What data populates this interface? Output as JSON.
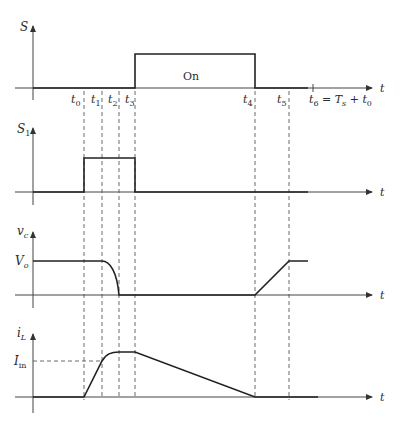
{
  "diagram": {
    "type": "timing-diagram",
    "time_axis_label": "t",
    "time_markers": [
      "t0",
      "t1",
      "t2",
      "t3",
      "t4",
      "t5",
      "t6 = Ts + t0"
    ],
    "panels": [
      {
        "id": "S",
        "ylabel": "S",
        "annotation": "On",
        "description": "Main switch gate signal: low until t3, high from t3 to t4, low after t4"
      },
      {
        "id": "S1",
        "ylabel": "S1",
        "description": "Auxiliary switch: high from t0 to t3"
      },
      {
        "id": "vc",
        "ylabel": "vc",
        "level_label": "Vo",
        "description": "Capacitor voltage: Vo until t1, resonant drop to zero at t2, zero until t4, linear rise to Vo at t5"
      },
      {
        "id": "iL",
        "ylabel": "iL",
        "level_label": "Iin",
        "description": "Inductor current: zero until t0, linear rise to Iin at t1, resonant rise to peak at t2, constant to t3, linear decrease to zero at t4"
      }
    ]
  },
  "labels": {
    "S": "S",
    "S1_main": "S",
    "S1_sub": "1",
    "vc_main": "v",
    "vc_sub": "c",
    "iL_main": "i",
    "iL_sub": "L",
    "Vo_main": "V",
    "Vo_sub": "o",
    "Iin_main": "I",
    "Iin_sub": "in",
    "on": "On",
    "t": "t",
    "t0": "t",
    "t0_sub": "0",
    "t1": "t",
    "t1_sub": "1",
    "t2": "t",
    "t2_sub": "2",
    "t3": "t",
    "t3_sub": "3",
    "t4": "t",
    "t4_sub": "4",
    "t5": "t",
    "t5_sub": "5",
    "t6": "t",
    "t6_sub": "6",
    "t6_eq": " = ",
    "t6_Ts": "T",
    "t6_Ts_sub": "s",
    "t6_plus": " + ",
    "t6_t0": "t",
    "t6_t0_sub": "0"
  }
}
